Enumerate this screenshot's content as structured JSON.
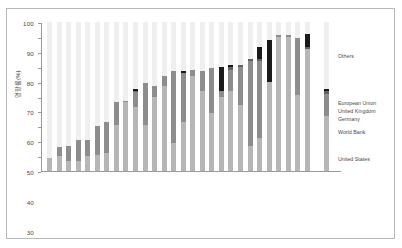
{
  "chart_data": {
    "type": "bar",
    "title": "",
    "subtitle": "",
    "xlabel": "",
    "ylabel": "영향률(%)",
    "ylim": [
      0,
      100
    ],
    "yticks": [
      0,
      10,
      20,
      30,
      40,
      50,
      60,
      70,
      80,
      90,
      100
    ],
    "ytick_labels": [
      "0",
      "10",
      "20",
      "30",
      "40",
      "50",
      "60",
      "70",
      "80",
      "90",
      "100"
    ],
    "grid": false,
    "stacked": true,
    "legend_position": "right",
    "series": [
      {
        "name": "United States",
        "color": "#b6b6b6",
        "values": [
          9,
          10,
          7,
          7,
          10,
          11,
          12,
          31,
          46,
          43,
          31,
          50,
          57,
          19,
          33,
          64,
          54,
          39,
          50,
          54,
          44,
          17,
          22,
          60,
          90,
          90,
          51,
          82
        ]
      },
      {
        "name": "Germany / United Kingdom / European Union",
        "color": "#8d8d8d",
        "values": [
          0,
          6,
          10,
          14,
          11,
          19,
          21,
          15,
          1,
          10,
          28,
          7,
          7,
          48,
          33,
          4,
          13,
          30,
          4,
          14,
          26,
          57,
          52,
          0,
          1,
          1,
          38,
          0
        ]
      },
      {
        "name": "World Bank",
        "color": "#626262",
        "values": [
          0,
          0,
          0,
          0,
          0,
          0,
          0,
          0,
          0,
          1,
          0,
          0,
          0,
          0,
          0,
          0,
          0,
          0,
          0,
          2,
          1,
          1,
          1,
          0,
          0,
          0,
          0,
          1
        ]
      },
      {
        "name": "Others",
        "color": "#1a1a1a",
        "values": [
          0,
          0,
          0,
          0,
          0,
          0,
          0,
          0,
          0,
          1,
          0,
          0,
          0,
          0,
          1,
          0,
          0,
          0,
          16,
          1,
          0,
          0,
          8,
          28,
          0,
          0,
          0,
          9
        ]
      }
    ],
    "categories": [
      "브라질",
      "말레이시아",
      "인도",
      "페루",
      "칠레",
      "아르헨티나",
      "중국",
      "멕시코",
      "터키",
      "카자흐스탄",
      "태국",
      "남아프리카",
      "콜롬비아",
      "필리핀",
      "베트남",
      "인도네시아",
      "이집트",
      "파키스탄",
      "나이지리아",
      "케냐",
      "방글라데시",
      "에티오피아",
      "탄자니아",
      "우간다",
      "모잠비크",
      "아프가니스탄",
      "네팔",
      "사하라이남아프리카"
    ],
    "totals": [
      9,
      16,
      17,
      21,
      21,
      30,
      33,
      46,
      47,
      55,
      59,
      57,
      64,
      67,
      67,
      68,
      67,
      69,
      70,
      71,
      71,
      75,
      83,
      88,
      91,
      91,
      89,
      92
    ],
    "extra_group": {
      "label": "전세계",
      "total": 55,
      "segments": [
        {
          "name": "United States",
          "value": 37,
          "color": "#b6b6b6"
        },
        {
          "name": "Germany / United Kingdom / European Union",
          "value": 15,
          "color": "#8d8d8d"
        },
        {
          "name": "World Bank",
          "value": 2,
          "color": "#626262"
        },
        {
          "name": "Others",
          "value": 1,
          "color": "#1a1a1a"
        }
      ]
    }
  },
  "legend": {
    "entries": [
      {
        "label": "Others"
      },
      {
        "label": "European Union"
      },
      {
        "label": "United Kingdom"
      },
      {
        "label": "Germany"
      },
      {
        "label": "World Bank"
      },
      {
        "label": "United States"
      }
    ]
  },
  "colors": {
    "united_states": "#b6b6b6",
    "world_bank": "#8d8d8d",
    "eu_uk_germany": "#626262",
    "others": "#1a1a1a",
    "bar_background": "#efefef",
    "axis": "#9a9a9a",
    "text": "#4a4a4a",
    "frame": "#b9b9b9"
  }
}
